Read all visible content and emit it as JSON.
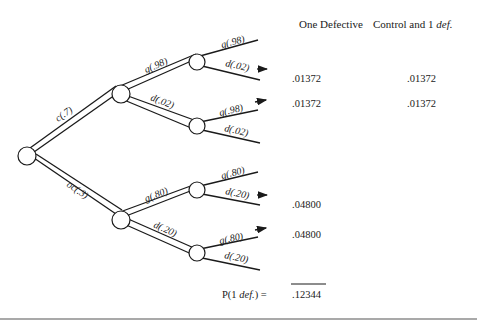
{
  "headers": {
    "col1": "One Defective",
    "col2_prefix": "Control and 1 ",
    "col2_italic": "def."
  },
  "tree": {
    "root_branches": [
      {
        "label": "c(.7)"
      },
      {
        "label": "oc(.3)"
      }
    ],
    "upper": {
      "level1": [
        {
          "label": "g(.98)"
        },
        {
          "label": "d(.02)"
        }
      ],
      "upper_leaf": [
        {
          "label": "g(.98)"
        },
        {
          "label": "d(.02)",
          "arrow": true
        }
      ],
      "lower_leaf": [
        {
          "label": "g(.98)",
          "arrow": true
        },
        {
          "label": "d(.02)"
        }
      ]
    },
    "lower": {
      "level1": [
        {
          "label": "g(.80)"
        },
        {
          "label": "d(.20)"
        }
      ],
      "upper_leaf": [
        {
          "label": "g(.80)"
        },
        {
          "label": "d(.20)",
          "arrow": true
        }
      ],
      "lower_leaf": [
        {
          "label": "g(.80)",
          "arrow": true
        },
        {
          "label": "d(.20)"
        }
      ]
    }
  },
  "values": {
    "one_defective": [
      ".01372",
      ".01372",
      ".04800",
      ".04800"
    ],
    "control_and_1_def": [
      ".01372",
      ".01372"
    ]
  },
  "total": {
    "label_prefix": "P(1 ",
    "label_italic": "def.",
    "label_suffix": ") =",
    "value": ".12344"
  }
}
